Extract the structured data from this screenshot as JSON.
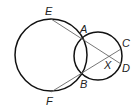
{
  "diagram": {
    "type": "geometry",
    "points": {
      "E": {
        "label": "E",
        "x": 51,
        "y": 19
      },
      "A": {
        "label": "A",
        "x": 82,
        "y": 38
      },
      "C": {
        "label": "C",
        "x": 119,
        "y": 44
      },
      "X": {
        "label": "X",
        "x": 107,
        "y": 56
      },
      "D": {
        "label": "D",
        "x": 118,
        "y": 65
      },
      "B": {
        "label": "B",
        "x": 82,
        "y": 75
      },
      "F": {
        "label": "F",
        "x": 51,
        "y": 92
      }
    },
    "circles": [
      {
        "name": "large",
        "cx": 51,
        "cy": 55,
        "r": 36
      },
      {
        "name": "small",
        "cx": 98,
        "cy": 56,
        "r": 24
      }
    ],
    "segments": [
      [
        "E",
        "D"
      ],
      [
        "F",
        "C"
      ]
    ],
    "line_color": "#555555",
    "circle_color": "#111111"
  }
}
